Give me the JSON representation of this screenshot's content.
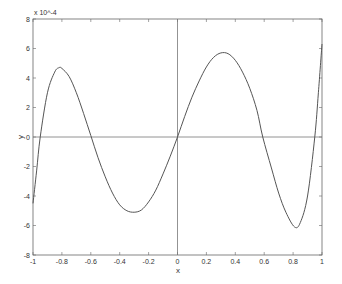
{
  "chart_data": {
    "type": "line",
    "title": "",
    "xlabel": "x",
    "ylabel": "y",
    "y_scale_note": "x 10^-4",
    "xlim": [
      -1,
      1
    ],
    "ylim": [
      -8,
      8
    ],
    "grid": false,
    "legend": null,
    "reference_lines": {
      "horizontal_y": 0,
      "vertical_x": 0
    },
    "x_ticks": [
      "-1",
      "-0.8",
      "-0.6",
      "-0.4",
      "-0.2",
      "0",
      "0.2",
      "0.4",
      "0.6",
      "0.8",
      "1"
    ],
    "y_ticks": [
      "-8",
      "-6",
      "-4",
      "-2",
      "0",
      "2",
      "4",
      "6",
      "8"
    ],
    "series": [
      {
        "name": "y",
        "color": "#555555",
        "x": [
          -1.0,
          -0.975,
          -0.95,
          -0.9,
          -0.85,
          -0.82,
          -0.8,
          -0.75,
          -0.7,
          -0.65,
          -0.6,
          -0.55,
          -0.5,
          -0.45,
          -0.4,
          -0.35,
          -0.3,
          -0.25,
          -0.2,
          -0.15,
          -0.1,
          -0.05,
          0.0,
          0.05,
          0.1,
          0.15,
          0.2,
          0.25,
          0.3,
          0.35,
          0.4,
          0.45,
          0.5,
          0.55,
          0.59,
          0.65,
          0.7,
          0.75,
          0.81,
          0.85,
          0.9,
          0.95,
          0.975,
          1.0
        ],
        "values": [
          -4.5,
          -2.3,
          0.0,
          3.0,
          4.4,
          4.7,
          4.65,
          4.1,
          3.0,
          1.6,
          0.1,
          -1.4,
          -2.7,
          -3.8,
          -4.6,
          -5.0,
          -5.1,
          -4.95,
          -4.4,
          -3.6,
          -2.5,
          -1.3,
          0.0,
          1.4,
          2.7,
          3.8,
          4.75,
          5.4,
          5.7,
          5.65,
          5.2,
          4.4,
          3.3,
          1.8,
          0.0,
          -2.1,
          -3.8,
          -5.1,
          -6.1,
          -5.8,
          -4.0,
          0.0,
          3.0,
          6.3
        ]
      }
    ]
  }
}
